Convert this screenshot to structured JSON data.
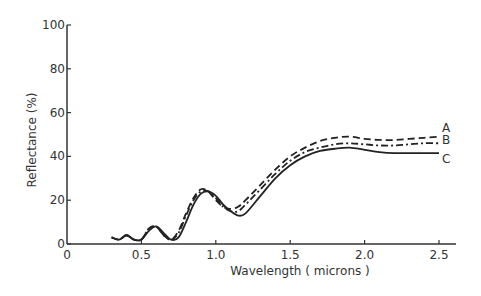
{
  "chart_data": {
    "type": "line",
    "title": "",
    "xlabel": "Wavelength  ( microns )",
    "ylabel": "Reflectance (%)",
    "xlim": [
      0,
      2.6
    ],
    "ylim": [
      0,
      100
    ],
    "xticks": [
      "0",
      "0.5",
      "1.0",
      "1.5",
      "2.0",
      "2.5"
    ],
    "xtick_values": [
      0,
      0.5,
      1.0,
      1.5,
      2.0,
      2.5
    ],
    "yticks": [
      "0",
      "20",
      "40",
      "60",
      "80",
      "100"
    ],
    "ytick_values": [
      0,
      20,
      40,
      60,
      80,
      100
    ],
    "grid": false,
    "legend_position": "inline labels at right end of curves",
    "series": [
      {
        "name": "A",
        "style": "dashed",
        "x": [
          0.3,
          0.35,
          0.4,
          0.45,
          0.5,
          0.55,
          0.6,
          0.65,
          0.7,
          0.75,
          0.8,
          0.85,
          0.9,
          0.95,
          1.0,
          1.05,
          1.1,
          1.15,
          1.2,
          1.3,
          1.4,
          1.5,
          1.6,
          1.7,
          1.8,
          1.9,
          2.0,
          2.1,
          2.2,
          2.3,
          2.4,
          2.5
        ],
        "y": [
          3,
          2,
          4,
          2,
          2,
          7,
          8,
          4,
          2,
          6,
          14,
          21,
          25,
          24,
          20,
          17,
          16,
          17,
          20,
          27,
          34,
          40,
          44,
          47,
          48.5,
          49,
          48,
          47.5,
          47.5,
          48,
          48.5,
          49
        ]
      },
      {
        "name": "B",
        "style": "dash-dot",
        "x": [
          0.3,
          0.35,
          0.4,
          0.45,
          0.5,
          0.55,
          0.6,
          0.65,
          0.7,
          0.75,
          0.8,
          0.85,
          0.9,
          0.95,
          1.0,
          1.05,
          1.1,
          1.15,
          1.2,
          1.3,
          1.4,
          1.5,
          1.6,
          1.7,
          1.8,
          1.9,
          2.0,
          2.1,
          2.2,
          2.3,
          2.4,
          2.5
        ],
        "y": [
          3,
          2,
          4,
          2,
          2,
          7,
          8,
          4,
          2,
          5,
          13,
          20,
          24,
          24,
          21,
          17,
          15,
          15,
          18,
          25,
          32,
          38,
          42,
          44,
          45.5,
          46,
          45.5,
          45,
          45,
          45.5,
          46,
          46
        ]
      },
      {
        "name": "C",
        "style": "solid",
        "x": [
          0.3,
          0.35,
          0.4,
          0.45,
          0.5,
          0.55,
          0.6,
          0.65,
          0.7,
          0.75,
          0.8,
          0.85,
          0.9,
          0.95,
          1.0,
          1.05,
          1.1,
          1.15,
          1.2,
          1.3,
          1.4,
          1.5,
          1.6,
          1.7,
          1.8,
          1.9,
          2.0,
          2.1,
          2.2,
          2.3,
          2.4,
          2.5
        ],
        "y": [
          3,
          2,
          4,
          2,
          2,
          6,
          8,
          5,
          2,
          3,
          10,
          18,
          23,
          24,
          22,
          18,
          15,
          13,
          14,
          22,
          30,
          36,
          40,
          42.5,
          43.5,
          44,
          43,
          42,
          41.5,
          41.5,
          41.5,
          41.5
        ]
      }
    ]
  }
}
